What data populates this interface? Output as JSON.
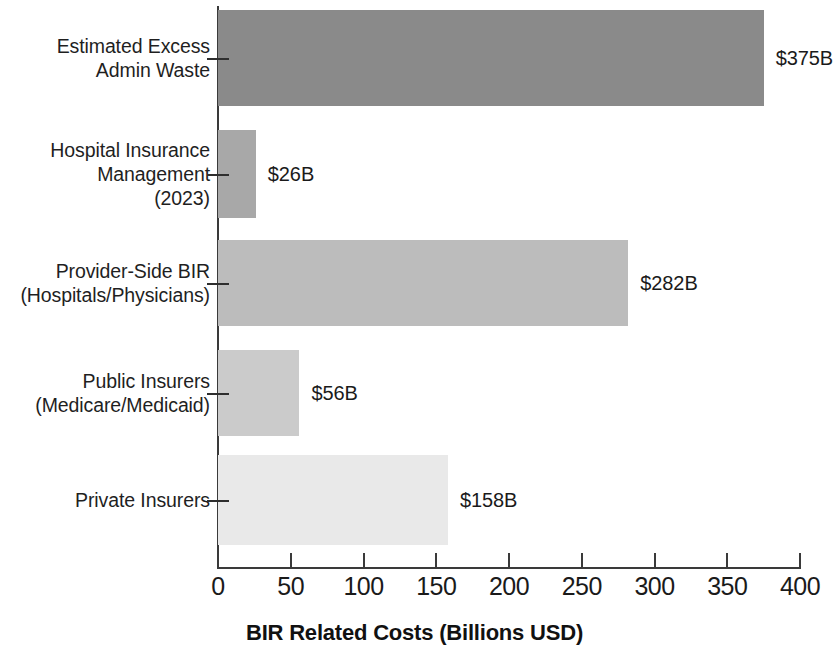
{
  "chart_data": {
    "type": "bar",
    "orientation": "horizontal",
    "title": "",
    "xlabel": "BIR Related Costs (Billions USD)",
    "ylabel": "",
    "xlim": [
      0,
      400
    ],
    "xticks": [
      0,
      50,
      100,
      150,
      200,
      250,
      300,
      350,
      400
    ],
    "xtick_labels": [
      "0",
      "50",
      "100",
      "150",
      "200",
      "250",
      "300",
      "350",
      "400"
    ],
    "grid": false,
    "legend": "none",
    "categories": [
      "Estimated Excess\nAdmin Waste",
      "Hospital Insurance\nManagement\n(2023)",
      "Provider-Side BIR\n(Hospitals/Physicians)",
      "Public Insurers\n(Medicare/Medicaid)",
      "Private Insurers"
    ],
    "values": [
      375,
      26,
      282,
      56,
      158
    ],
    "value_labels": [
      "$375B",
      "$26B",
      "$282B",
      "$56B",
      "$158B"
    ],
    "bar_colors": [
      "#8a8a8a",
      "#a8a8a8",
      "#bcbcbc",
      "#cbcbcb",
      "#e9e9e9"
    ]
  },
  "axis": {
    "x_title": "BIR Related Costs (Billions USD)"
  }
}
